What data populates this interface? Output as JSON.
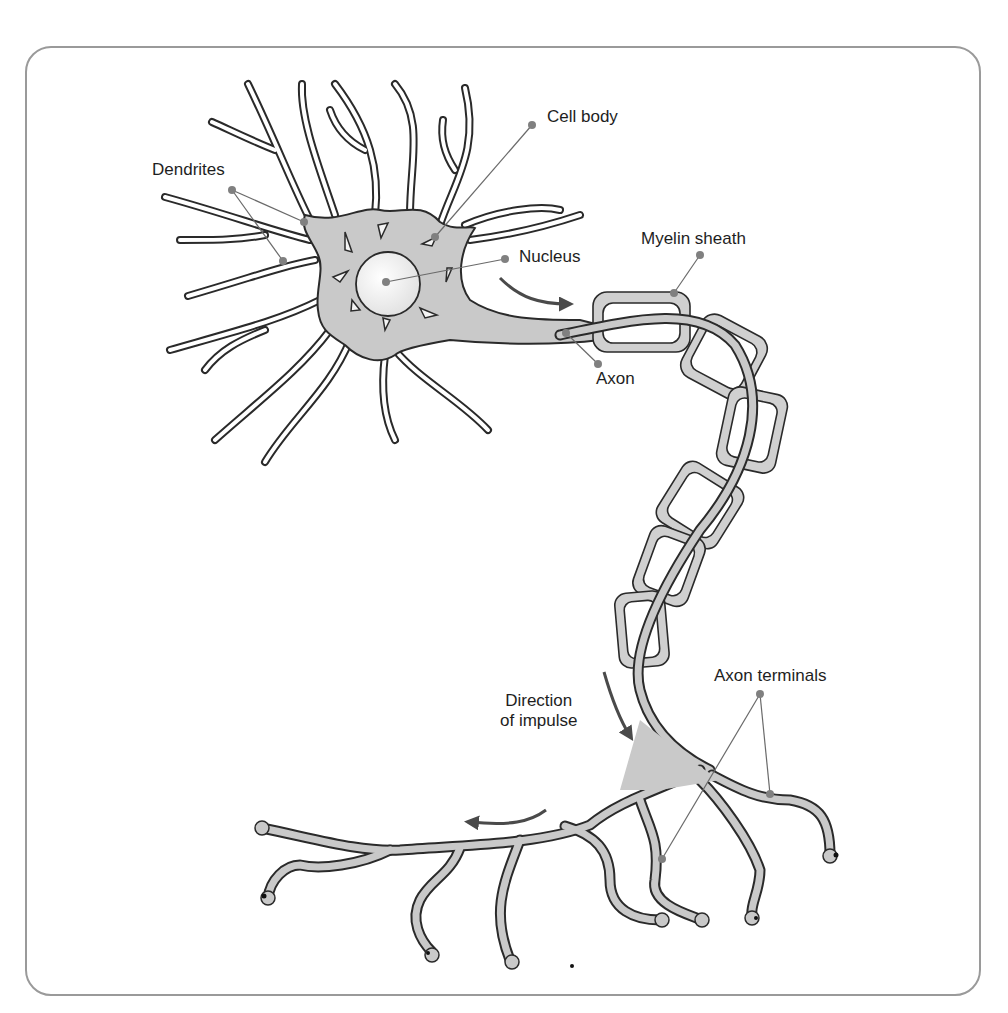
{
  "diagram": {
    "labels": {
      "dendrites": "Dendrites",
      "cell_body": "Cell body",
      "nucleus": "Nucleus",
      "myelin_sheath": "Myelin sheath",
      "axon": "Axon",
      "direction_line1": "Direction",
      "direction_line2": "of impulse",
      "axon_terminals": "Axon terminals"
    },
    "colors": {
      "cell_fill": "#c9c9c9",
      "outline": "#2a2a2a",
      "leader_line": "#6a6a6a",
      "leader_dot": "#808080",
      "nucleus_fill": "#ececec",
      "frame": "#9a9a9a",
      "arrow": "#4a4a4a"
    }
  }
}
